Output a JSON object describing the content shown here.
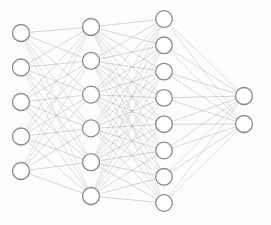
{
  "diagram": {
    "type": "neural-network-graph",
    "canvas": {
      "width": 271,
      "height": 225,
      "background": "#fdfdfd"
    },
    "style": {
      "node_fill": "#ffffff",
      "node_stroke": "#8a8a8a",
      "node_stroke_width": 1.3,
      "edge_color": "#a6a6a6",
      "edge_width": 0.55,
      "edge_opacity": 0.85
    },
    "layers": [
      {
        "name": "input-layer",
        "label": "Input Layer",
        "node_count": 5,
        "x": 21,
        "radius": 8.5,
        "node_y": [
          33,
          67.5,
          102,
          136.5,
          171
        ]
      },
      {
        "name": "hidden-layer-1",
        "label": "Hidden Layer 1",
        "node_count": 6,
        "x": 91,
        "radius": 8.5,
        "node_y": [
          27,
          60.8,
          94.6,
          128.4,
          162.2,
          196
        ]
      },
      {
        "name": "hidden-layer-2",
        "label": "Hidden Layer 2",
        "node_count": 8,
        "x": 164,
        "radius": 8.3,
        "node_y": [
          19,
          45.3,
          71.6,
          97.9,
          124.2,
          150.5,
          176.8,
          203
        ]
      },
      {
        "name": "output-layer",
        "label": "Output Layer",
        "node_count": 2,
        "x": 244,
        "radius": 8.5,
        "node_y": [
          96,
          124
        ]
      }
    ],
    "connections": [
      {
        "name": "input-to-hidden1",
        "from": 0,
        "to": 1,
        "fully_connected": true,
        "edge_count": 30
      },
      {
        "name": "hidden1-to-hidden2",
        "from": 1,
        "to": 2,
        "fully_connected": true,
        "edge_count": 48
      },
      {
        "name": "hidden2-to-output",
        "from": 2,
        "to": 3,
        "fully_connected": true,
        "edge_count": 16
      }
    ],
    "totals": {
      "nodes": 21,
      "edges": 94
    }
  }
}
